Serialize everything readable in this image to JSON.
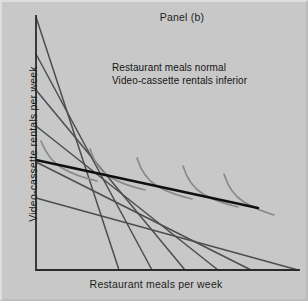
{
  "figure": {
    "panel_title": "Panel (b)",
    "annotation_line1": "Restaurant meals normal",
    "annotation_line2": "Video-cassette rentals inferior",
    "background_color": "#c8c8c8",
    "axis_color": "#2b2b2b",
    "budget_line_color": "#4d4d4d",
    "indifference_curve_color": "#8a8a8a",
    "icc_color": "#101010"
  },
  "chart_data": {
    "type": "line",
    "title": "Panel (b)",
    "xlabel": "Restaurant meals per week",
    "ylabel": "Video-cassette rentals per week",
    "grid": false,
    "legend": "none",
    "annotations": [
      "Restaurant meals normal",
      "Video-cassette rentals inferior"
    ],
    "xlim": [
      0,
      100
    ],
    "ylim": [
      0,
      100
    ],
    "axis_origin_px": [
      34,
      268
    ],
    "plot_extent_px": [
      296,
      14
    ],
    "budget_lines": {
      "count": 6,
      "description": "Parallel downward-sloping budget constraints shifting outward as income rises",
      "slope_px": -1.0,
      "lines": [
        {
          "name": "budget-line-1",
          "x1": 34,
          "y1": 15,
          "x2": 117,
          "y2": 268
        },
        {
          "name": "budget-line-2",
          "x1": 34,
          "y1": 52,
          "x2": 150,
          "y2": 268
        },
        {
          "name": "budget-line-3",
          "x1": 34,
          "y1": 88,
          "x2": 183,
          "y2": 268
        },
        {
          "name": "budget-line-4",
          "x1": 34,
          "y1": 124,
          "x2": 216,
          "y2": 268
        },
        {
          "name": "budget-line-5",
          "x1": 34,
          "y1": 160,
          "x2": 249,
          "y2": 268
        },
        {
          "name": "budget-line-6",
          "x1": 34,
          "y1": 196,
          "x2": 296,
          "y2": 268
        }
      ]
    },
    "indifference_curves": {
      "count": 5,
      "description": "Convex indifference curves, each tangent to one budget line",
      "tangency_points_px": [
        {
          "name": "tangency-1",
          "x": 57,
          "y": 164
        },
        {
          "name": "tangency-2",
          "x": 105,
          "y": 173
        },
        {
          "name": "tangency-3",
          "x": 152,
          "y": 182
        },
        {
          "name": "tangency-4",
          "x": 198,
          "y": 190
        },
        {
          "name": "tangency-5",
          "x": 238,
          "y": 198
        }
      ]
    },
    "income_consumption_curve": {
      "name": "income-consumption-curve",
      "description": "Downward-sloping ICC: as income rises, restaurant meals rise while video-cassette rentals fall",
      "x1": 34,
      "y1": 158,
      "x2": 256,
      "y2": 206,
      "slope": "negative"
    }
  }
}
